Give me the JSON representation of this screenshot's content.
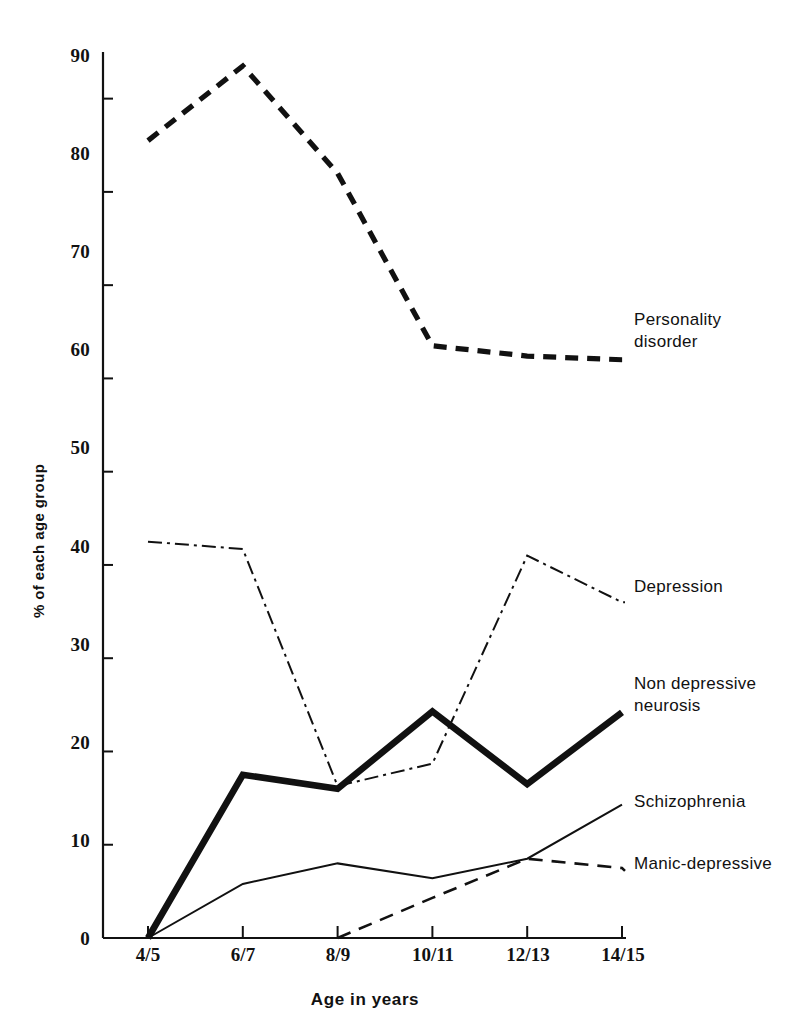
{
  "chart_data": {
    "type": "line",
    "title": "",
    "xlabel": "Age in years",
    "ylabel": "% of each age group",
    "categories": [
      "4/5",
      "6/7",
      "8/9",
      "10/11",
      "12/13",
      "14/15"
    ],
    "xlim": [
      0,
      5
    ],
    "ylim": [
      0,
      95
    ],
    "yticks": [
      0,
      10,
      20,
      30,
      40,
      50,
      60,
      70,
      80,
      90
    ],
    "ytick_labels": [
      "0",
      "10",
      "20",
      "30",
      "40",
      "50",
      "60",
      "70",
      "80",
      "90"
    ],
    "grid": false,
    "legend_position": "right-inline-labels",
    "series": [
      {
        "name": "Personality disorder",
        "label": "Personality\ndisorder",
        "style": "dashed-thick",
        "color": "#111111",
        "values": [
          85.5,
          93.5,
          82.0,
          63.5,
          62.4,
          62.0
        ]
      },
      {
        "name": "Depression",
        "label": "Depression",
        "style": "dash-dot-thin",
        "color": "#111111",
        "values": [
          42.5,
          41.7,
          16.3,
          18.7,
          41.0,
          36.0
        ]
      },
      {
        "name": "Non depressive neurosis",
        "label": "Non depressive\nneurosis",
        "style": "solid-thick",
        "color": "#111111",
        "values": [
          0.0,
          17.5,
          16.0,
          24.3,
          16.5,
          24.2
        ]
      },
      {
        "name": "Schizophrenia",
        "label": "Schizophrenia",
        "style": "solid-thin",
        "color": "#111111",
        "values": [
          0.0,
          5.8,
          8.0,
          6.4,
          8.5,
          14.3
        ]
      },
      {
        "name": "Manic-depressive",
        "label": "Manic-depressive",
        "style": "dashed-thin",
        "color": "#111111",
        "values": [
          null,
          null,
          0.0,
          4.3,
          8.5,
          7.5
        ]
      }
    ]
  },
  "axes": {
    "x_title": "Age in years",
    "y_title": "% of each age group"
  },
  "series_labels": {
    "personality_line1": "Personality",
    "personality_line2": "disorder",
    "depression": "Depression",
    "nondepressive_line1": "Non depressive",
    "nondepressive_line2": "neurosis",
    "schizophrenia": "Schizophrenia",
    "manic": "Manic-depressive"
  },
  "ytick_labels": [
    "90",
    "80",
    "70",
    "60",
    "50",
    "40",
    "30",
    "20",
    "10",
    "0"
  ],
  "xtick_labels": [
    "4/5",
    "6/7",
    "8/9",
    "10/11",
    "12/13",
    "14/15"
  ]
}
